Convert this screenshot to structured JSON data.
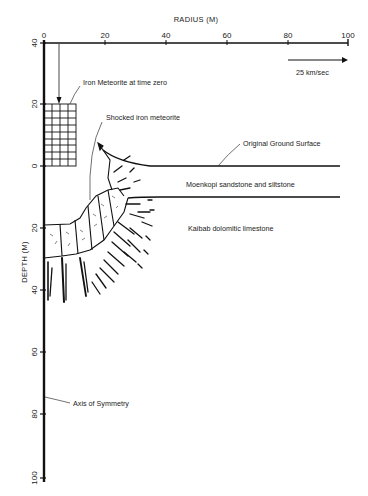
{
  "figure": {
    "x_axis": {
      "title": "RADIUS (M)",
      "ticks": [
        "0",
        "20",
        "40",
        "60",
        "80",
        "100"
      ]
    },
    "y_axis": {
      "title": "DEPTH (M)",
      "ticks_above": [
        "40",
        "20"
      ],
      "ticks_below": [
        "0",
        "20",
        "40",
        "60",
        "80",
        "100"
      ]
    },
    "scale_arrow": {
      "label": "25 km/sec"
    },
    "labels": {
      "meteorite_initial": "Iron Meteorite at time zero",
      "shocked_meteorite": "Shocked iron meteorite",
      "ground_surface": "Original Ground Surface",
      "moenkopi": "Moenkopi sandstone and siltstone",
      "kaibab": "Kaibab dolomitic limestone",
      "axis_symmetry": "Axis of Symmetry"
    }
  }
}
